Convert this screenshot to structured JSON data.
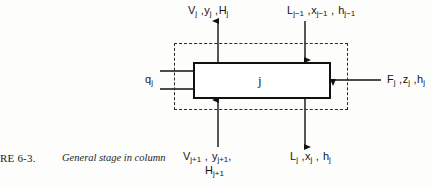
{
  "figure": {
    "caption_number": "RE 6-3.",
    "caption_text": "General stage in column",
    "stage_label": "j",
    "type": "process-flow-diagram"
  },
  "streams": {
    "vapor_out": {
      "name": "vapor-leaving-stage",
      "direction": "up",
      "text": "Vⱼ ,yⱼ ,Hⱼ",
      "parts": [
        "V",
        "j",
        " ,",
        "y",
        "j",
        " ,",
        "H",
        "j"
      ]
    },
    "liquid_in": {
      "name": "liquid-entering-from-stage-above",
      "direction": "down",
      "text": "Lⱼ₋₁ ,xⱼ₋₁ , hⱼ₋₁",
      "parts": [
        "L",
        "j-1",
        " ,",
        "x",
        "j-1",
        " ,",
        "h",
        "j-1"
      ]
    },
    "feed": {
      "name": "feed-stream",
      "direction": "left",
      "text": "Fⱼ ,zⱼ ,hⱼ",
      "parts": [
        "F",
        "j",
        " ,",
        "z",
        "j",
        " ,",
        "h",
        "j"
      ]
    },
    "heat_duty": {
      "name": "heat-duty",
      "direction": "right",
      "text": "qⱼ",
      "parts": [
        "q",
        "j"
      ]
    },
    "vapor_in": {
      "name": "vapor-entering-from-stage-below",
      "direction": "up",
      "line1": "Vⱼ₊₁ , yⱼ₊₁,",
      "line2": "Hⱼ₊₁"
    },
    "liquid_out": {
      "name": "liquid-leaving-stage",
      "direction": "down",
      "text": "Lⱼ ,xⱼ , hⱼ",
      "parts": [
        "L",
        "j",
        " ,",
        "x",
        "j",
        " ,",
        "h",
        "j"
      ]
    }
  },
  "colors": {
    "ink": "#151515",
    "box_stroke": "#111111",
    "dashed_stroke": "#2b2b2b",
    "paper": "#fdfdfc"
  }
}
